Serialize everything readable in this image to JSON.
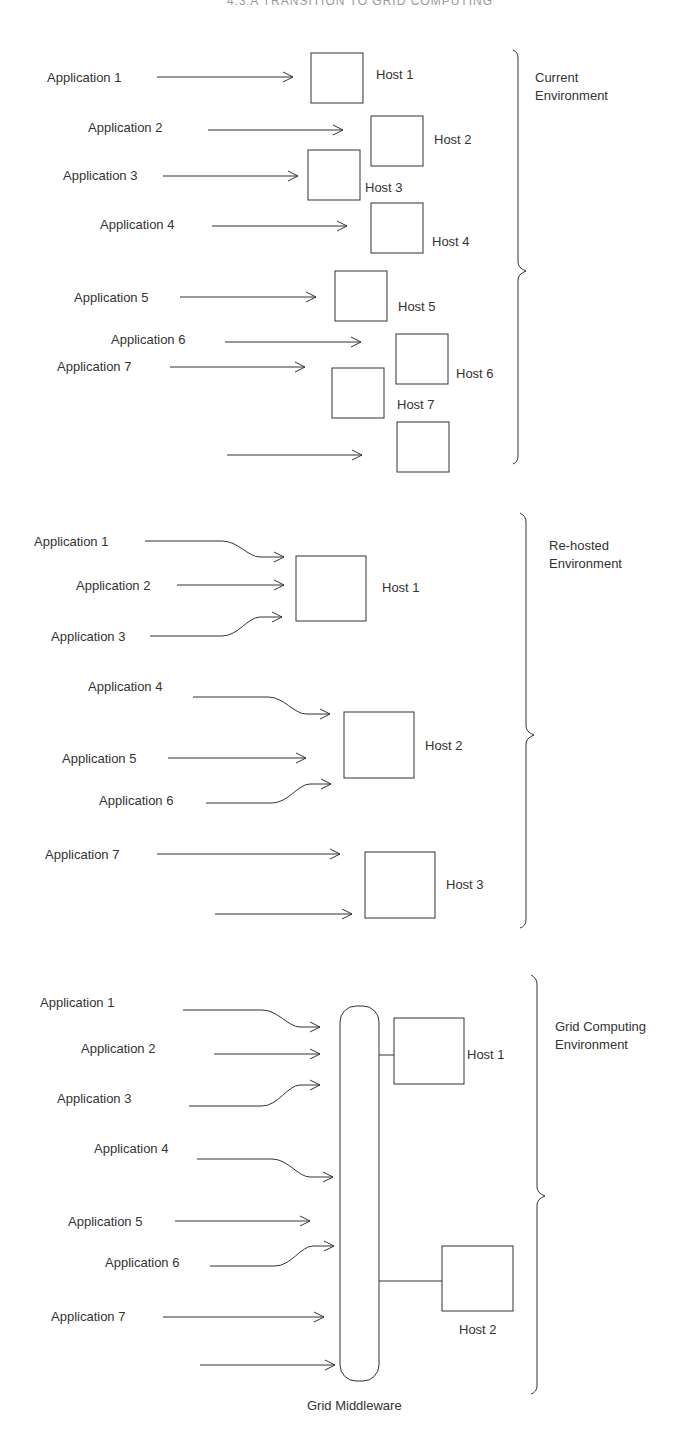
{
  "title": "4.3  A TRANSITION TO GRID COMPUTING",
  "sections": [
    {
      "id": "current",
      "env_label": [
        "Current",
        "Environment"
      ],
      "applications": [
        "Application 1",
        "Application 2",
        "Application 3",
        "Application 4",
        "Application 5",
        "Application 6",
        "Application 7"
      ],
      "hosts": [
        "Host 1",
        "Host 2",
        "Host 3",
        "Host 4",
        "Host 5",
        "Host 6",
        "Host 7"
      ]
    },
    {
      "id": "rehosted",
      "env_label": [
        "Re-hosted",
        "Environment"
      ],
      "applications": [
        "Application 1",
        "Application 2",
        "Application 3",
        "Application 4",
        "Application 5",
        "Application 6",
        "Application 7"
      ],
      "hosts": [
        "Host 1",
        "Host 2",
        "Host 3"
      ]
    },
    {
      "id": "grid",
      "env_label": [
        "Grid Computing",
        "Environment"
      ],
      "applications": [
        "Application 1",
        "Application 2",
        "Application 3",
        "Application 4",
        "Application 5",
        "Application 6",
        "Application 7"
      ],
      "hosts": [
        "Host 1",
        "Host 2"
      ],
      "middleware_label": "Grid Middleware"
    }
  ],
  "colors": {
    "stroke": "#333333",
    "text": "#333333",
    "background": "#ffffff"
  }
}
